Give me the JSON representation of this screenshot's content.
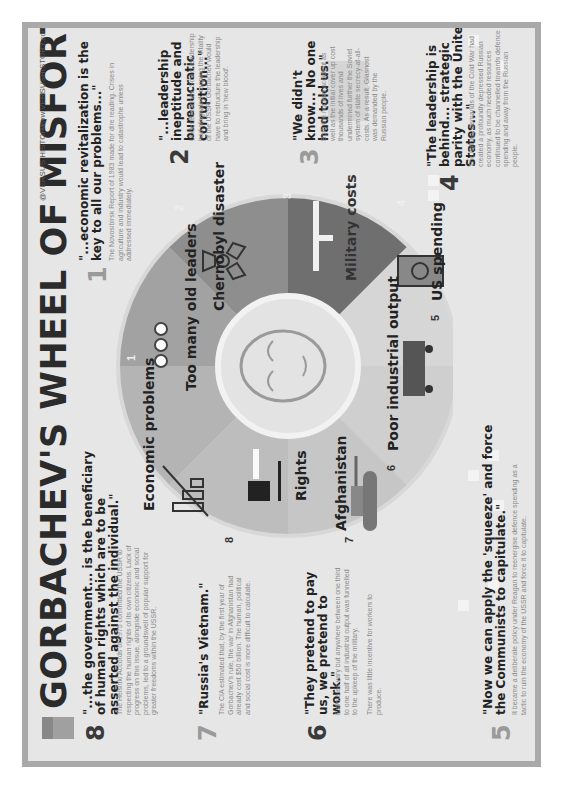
{
  "header": {
    "title": "GORBACHEV'S WHEEL OF MISFORTUNE",
    "handle": "@VERSUS HISTORY",
    "url": "www.VERSUSHISTORY.com"
  },
  "colors": {
    "card_bg": "#e6e6e6",
    "border": "#a9a9a9",
    "wedge_light": "#c9c9c9",
    "wedge_mid": "#b0b0b0",
    "wedge_dark": "#8c8c8c",
    "wedge_darker": "#777777",
    "text_dark": "#222222",
    "text_body": "#8a8a8a"
  },
  "wheel": {
    "segments": [
      {
        "num": "1",
        "label": "Economic problems",
        "icon": "bar-chart-icon"
      },
      {
        "num": "2",
        "label": "Too many old leaders",
        "icon": "org-chart-icon"
      },
      {
        "num": "3",
        "label": "Chernobyl disaster",
        "icon": "radiation-icon"
      },
      {
        "num": "4",
        "label": "Military costs",
        "icon": "rifle-icon"
      },
      {
        "num": "5",
        "label": "US spending",
        "icon": "dollar-bill-icon"
      },
      {
        "num": "6",
        "label": "Poor industrial output",
        "icon": "factory-train-icon"
      },
      {
        "num": "7",
        "label": "Afghanistan",
        "icon": "tank-icon"
      },
      {
        "num": "8",
        "label": "Rights",
        "icon": "gavel-icon"
      }
    ],
    "center": "gorbachev-portrait"
  },
  "items": [
    {
      "num": "1",
      "quote": "\"...economic revitalization is the key to all our problems...\"",
      "body": "The Novosibirsk Report of 1983 made for dire reading. Crises in agriculture and industry would lead to catastrophe unless addressed immediately."
    },
    {
      "num": "2",
      "quote": "\"...leadership ineptitude and bureaucratic corruption...\"",
      "body": "Under Brezhnev, Soviet leadership had stagnated, sapping the vitality of the USSR. Gorbachev would have to restructure the leadership and bring in 'new blood'."
    },
    {
      "num": "3",
      "quote": "\"We didn't know... No one had told us.\"",
      "body": "Both the nuclear accident as well as the initial cover up cost thousands of lives and undermined further the Soviet system of state secrecy-at-all-costs. As a result, Glasnost was demanded by the Russian people."
    },
    {
      "num": "4",
      "quote": "\"The leadership is behind... strategic parity with the United States...\"",
      "body": "The military demands of the Cold War had created a profoundly depressed Russian economy, as much needed resources continued to be channelled towards defence spending and away from the Russian people."
    },
    {
      "num": "5",
      "quote": "\"Now we can apply the 'squeeze' and force the Communists to capitulate.\"",
      "body": "It became a deliberate policy under Reagan to reenergise defence spending as a tactic to ruin the economy of the USSR and force it to capitulate."
    },
    {
      "num": "6",
      "quote": "\"They pretend to pay us, we pretend to work.\"",
      "body": "Estimates vary but anywhere between one third to one half of all industrial output was funnelled to the upkeep of the military.",
      "body2": "There was little incentive for workers to produce."
    },
    {
      "num": "7",
      "quote": "\"Russia's Vietnam.\"",
      "body": "The CIA estimated that, by the first year of Gorbachev's rule, the war in Afghanistan had already cost $50 billion. The human, political and social cost is more difficult to calculate."
    },
    {
      "num": "8",
      "quote": "\"...the government... is the beneficiary of human rights which are to be asserted against the individual.\"",
      "body": "The Helsinki Accords of 1975 committed the USSR to respecting the human rights of its own citizens. Lack of progress on this issue, alongside economic and social problems, led to a groundswell of popular support for greater freedoms within the USSR."
    }
  ]
}
